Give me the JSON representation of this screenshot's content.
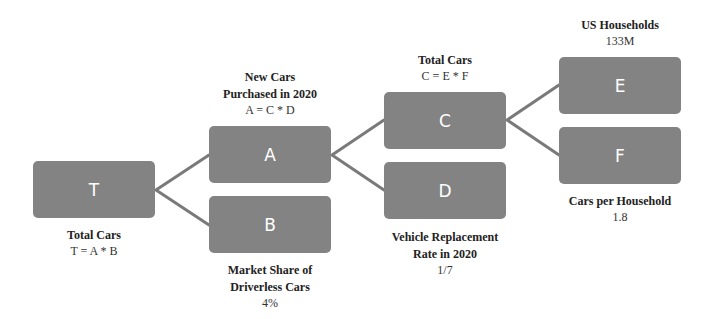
{
  "diagram": {
    "type": "driver-tree",
    "nodes": {
      "T": {
        "letter": "T",
        "title_lines": [
          "Total Cars"
        ],
        "value": "T = A * B"
      },
      "A": {
        "letter": "A",
        "title_lines": [
          "New Cars",
          "Purchased in 2020"
        ],
        "value": "A = C * D"
      },
      "B": {
        "letter": "B",
        "title_lines": [
          "Market Share of",
          "Driverless Cars"
        ],
        "value": "4%"
      },
      "C": {
        "letter": "C",
        "title_lines": [
          "Total Cars"
        ],
        "value": "C = E * F"
      },
      "D": {
        "letter": "D",
        "title_lines": [
          "Vehicle Replacement",
          "Rate in 2020"
        ],
        "value": "1/7"
      },
      "E": {
        "letter": "E",
        "title_lines": [
          "US Households"
        ],
        "value": "133M"
      },
      "F": {
        "letter": "F",
        "title_lines": [
          "Cars per Household"
        ],
        "value": "1.8"
      }
    },
    "edges": [
      [
        "T",
        "A"
      ],
      [
        "T",
        "B"
      ],
      [
        "A",
        "C"
      ],
      [
        "A",
        "D"
      ],
      [
        "C",
        "E"
      ],
      [
        "C",
        "F"
      ]
    ],
    "colors": {
      "node_fill": "#838383",
      "connector": "#7a7a7a",
      "node_text": "#ffffff"
    }
  }
}
